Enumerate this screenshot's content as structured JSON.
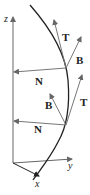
{
  "diagram": {
    "type": "space-curve-frenet-frame",
    "axes": {
      "z_label": "z",
      "y_label": "y",
      "x_label": "x"
    },
    "points": [
      {
        "name": "upper",
        "vectors": {
          "T": "T",
          "B": "B",
          "N": "N"
        }
      },
      {
        "name": "lower",
        "vectors": {
          "T": "T",
          "B": "B",
          "N": "N"
        }
      }
    ],
    "colors": {
      "curve": "#222222",
      "vectors": "#777777",
      "axes": "#666666",
      "labels": "#222222"
    }
  }
}
